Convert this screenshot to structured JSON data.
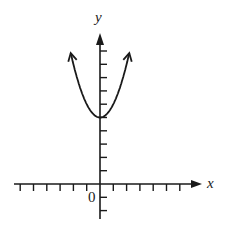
{
  "chart_data": {
    "type": "line",
    "title": "",
    "xlabel": "x",
    "ylabel": "y",
    "origin_label": "0",
    "function": "y = x^2 + 5",
    "series": [
      {
        "name": "parabola",
        "x": [
          -2.25,
          -2,
          -1.5,
          -1,
          -0.5,
          0,
          0.5,
          1,
          1.5,
          2,
          2.25
        ],
        "values": [
          10.06,
          9,
          7.25,
          6,
          5.25,
          5,
          5.25,
          6,
          7.25,
          9,
          10.06
        ]
      }
    ],
    "vertex": [
      0,
      5
    ],
    "xlim": [
      -7,
      7.5
    ],
    "ylim": [
      -2,
      11
    ],
    "x_ticks_left": 6,
    "x_ticks_right": 6,
    "y_ticks_above": 10,
    "y_ticks_below": 2,
    "grid": false,
    "arrows": {
      "curve_ends": true,
      "x_axis_positive": true,
      "y_axis_positive": true
    },
    "colors": {
      "ink": "#1a1a1a",
      "background": "#ffffff"
    }
  },
  "labels": {
    "x": "x",
    "y": "y",
    "origin": "0"
  }
}
